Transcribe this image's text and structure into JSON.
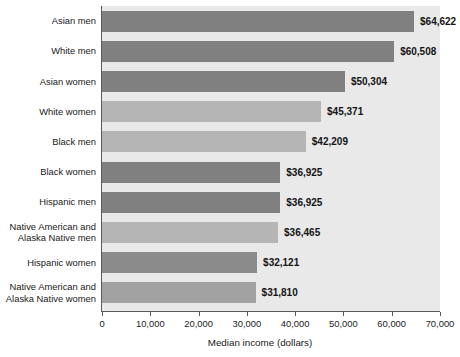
{
  "chart_data": {
    "type": "bar",
    "orientation": "horizontal",
    "title": "",
    "xlabel": "Median income (dollars)",
    "ylabel": "",
    "xlim": [
      0,
      70000
    ],
    "grid": false,
    "legend": null,
    "categories": [
      "Asian men",
      "White men",
      "Asian women",
      "White women",
      "Black men",
      "Black women",
      "Hispanic men",
      "Native American and\nAlaska Native men",
      "Hispanic women",
      "Native American and\nAlaska Native women"
    ],
    "values": [
      64622,
      60508,
      50304,
      45371,
      42209,
      36925,
      36925,
      36465,
      32121,
      31810
    ],
    "value_labels": [
      "$64,622",
      "$60,508",
      "$50,304",
      "$45,371",
      "$42,209",
      "$36,925",
      "$36,925",
      "$36,465",
      "$32,121",
      "$31,810"
    ],
    "bar_colors": [
      "#808080",
      "#808080",
      "#808080",
      "#b5b5b5",
      "#b5b5b5",
      "#808080",
      "#808080",
      "#b5b5b5",
      "#8b8b8b",
      "#a2a2a2"
    ],
    "xticks": [
      0,
      10000,
      20000,
      30000,
      40000,
      50000,
      60000,
      70000
    ],
    "xtick_labels": [
      "0",
      "10,000",
      "20,000",
      "30,000",
      "40,000",
      "50,000",
      "60,000",
      "70,000"
    ],
    "plot_background": "#e9e9e9",
    "axis_color": "#5a5a5a",
    "text_color": "#1a1a1a"
  }
}
